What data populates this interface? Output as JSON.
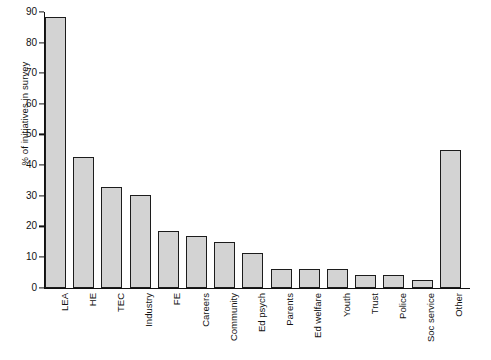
{
  "chart_data": {
    "type": "bar",
    "title": "",
    "xlabel": "",
    "ylabel": "% of initiatives in survey",
    "ylim": [
      0,
      90
    ],
    "yticks": [
      0,
      10,
      20,
      30,
      40,
      50,
      60,
      70,
      80,
      90
    ],
    "grid": false,
    "legend": "none",
    "bar_fill_color": "#d3d3d3",
    "bar_edge_color": "#1c1c1c",
    "categories": [
      "LEA",
      "HE",
      "TEC",
      "Industry",
      "FE",
      "Careers",
      "Community",
      "Ed psych",
      "Parents",
      "Ed welfare",
      "Youth",
      "Trust",
      "Police",
      "Soc service",
      "Other"
    ],
    "values": [
      88.5,
      42.5,
      33,
      30.3,
      18.5,
      17,
      15,
      11.3,
      6,
      6,
      6,
      4,
      4,
      2.5,
      45
    ]
  }
}
